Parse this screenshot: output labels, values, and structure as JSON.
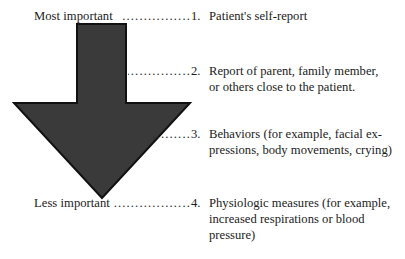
{
  "figure": {
    "arrow": {
      "name": "downward-arrow",
      "direction": "down",
      "fill_color": "#3a3a3a",
      "stroke_color": "#111111",
      "meaning": "decreasing importance from top to bottom"
    },
    "axis_labels": {
      "top": "Most important",
      "bottom": "Less important"
    },
    "leader_char": ".",
    "items": [
      {
        "number": "1.",
        "lines": [
          "Patient's self-report"
        ],
        "leader": "..........................."
      },
      {
        "number": "2.",
        "lines": [
          "Report of parent, family member,",
          "or others close to the patient."
        ],
        "leader": "..................."
      },
      {
        "number": "3.",
        "lines": [
          "Behaviors (for example, facial ex-",
          "pressions, body movements, crying)"
        ],
        "leader": ".............."
      },
      {
        "number": "4.",
        "lines": [
          "Physiologic measures (for example,",
          "increased respirations or blood",
          "pressure)"
        ],
        "leader": "............................."
      }
    ]
  }
}
